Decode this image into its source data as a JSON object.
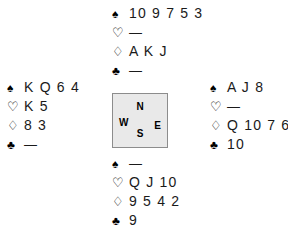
{
  "diagram": {
    "background_color": "#ffffff",
    "text_color": "#1a1a1a"
  },
  "suits": {
    "spades": {
      "name": "spade-symbol",
      "glyph": "♠",
      "style": "filled"
    },
    "hearts": {
      "name": "heart-symbol",
      "glyph": "♡",
      "style": "hollow"
    },
    "diamonds": {
      "name": "diamond-symbol",
      "glyph": "♢",
      "style": "hollow"
    },
    "clubs": {
      "name": "club-symbol",
      "glyph": "♣",
      "style": "filled"
    }
  },
  "void_marker": "—",
  "compass": {
    "name": "compass-box",
    "fill_color": "#e9e9e9",
    "border_color": "#8c8c8c",
    "north": "N",
    "west": "W",
    "east": "E",
    "south": "S"
  },
  "hands": {
    "north": {
      "position": "North",
      "spades": "10 9 7 5 3",
      "hearts": "—",
      "diamonds": "A K J",
      "clubs": "—"
    },
    "west": {
      "position": "West",
      "spades": "K Q 6 4",
      "hearts": "K 5",
      "diamonds": "8 3",
      "clubs": "—"
    },
    "east": {
      "position": "East",
      "spades": "A J 8",
      "hearts": "—",
      "diamonds": "Q 10 7 6",
      "clubs": "10"
    },
    "south": {
      "position": "South",
      "spades": "—",
      "hearts": "Q J 10",
      "diamonds": "9 5 4 2",
      "clubs": "9"
    }
  }
}
